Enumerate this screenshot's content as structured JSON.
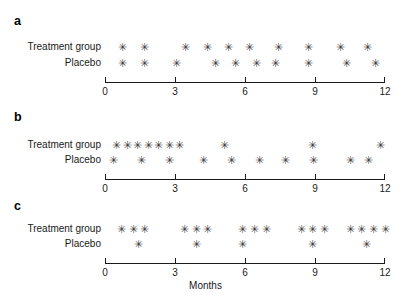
{
  "figure": {
    "marker_glyph": "✳",
    "marker_color": "#3a3a3a",
    "axis_color": "#1a1a1a",
    "axis_title": "Months"
  },
  "axis": {
    "min": 0,
    "max": 12,
    "ticks": [
      0,
      3,
      6,
      9,
      12
    ],
    "tick_labels": [
      "0",
      "3",
      "6",
      "9",
      "12"
    ]
  },
  "rows": {
    "treatment_label": "Treatment group",
    "placebo_label": "Placebo"
  },
  "panels": [
    {
      "letter": "a"
    },
    {
      "letter": "b"
    },
    {
      "letter": "c"
    }
  ],
  "chart_data": [
    {
      "type": "scatter",
      "title": "a",
      "xlabel": "Months",
      "ylabel": "",
      "xlim": [
        0,
        12
      ],
      "grid": false,
      "legend": "none",
      "categories": [
        "Treatment group",
        "Placebo"
      ],
      "series": [
        {
          "name": "Treatment group",
          "x": [
            0.75,
            1.7,
            3.45,
            4.4,
            5.3,
            6.2,
            7.45,
            8.7,
            10.1,
            11.25
          ],
          "count": 10
        },
        {
          "name": "Placebo",
          "x": [
            0.75,
            1.7,
            3.05,
            4.75,
            5.6,
            6.5,
            7.3,
            8.7,
            10.35,
            11.6
          ],
          "count": 10
        }
      ]
    },
    {
      "type": "scatter",
      "title": "b",
      "xlabel": "Months",
      "ylabel": "",
      "xlim": [
        0,
        12
      ],
      "grid": false,
      "legend": "none",
      "categories": [
        "Treatment group",
        "Placebo"
      ],
      "series": [
        {
          "name": "Treatment group",
          "x": [
            0.5,
            0.95,
            1.4,
            1.85,
            2.3,
            2.75,
            3.2,
            5.1,
            8.9,
            11.8
          ],
          "count": 10
        },
        {
          "name": "Placebo",
          "x": [
            0.35,
            1.55,
            2.75,
            4.2,
            5.4,
            6.6,
            7.75,
            8.95,
            10.5,
            11.3
          ],
          "count": 10
        }
      ]
    },
    {
      "type": "scatter",
      "title": "c",
      "xlabel": "Months",
      "ylabel": "",
      "xlim": [
        0,
        12
      ],
      "grid": false,
      "legend": "none",
      "categories": [
        "Treatment group",
        "Placebo"
      ],
      "series": [
        {
          "name": "Treatment group",
          "x": [
            0.7,
            1.2,
            1.7,
            3.4,
            3.9,
            4.4,
            5.9,
            6.4,
            6.9,
            8.4,
            8.9,
            9.4,
            10.5,
            11.0,
            11.5,
            12.0
          ],
          "count": 16
        },
        {
          "name": "Placebo",
          "x": [
            1.45,
            3.9,
            5.9,
            8.9,
            11.2
          ],
          "count": 5
        }
      ]
    }
  ]
}
